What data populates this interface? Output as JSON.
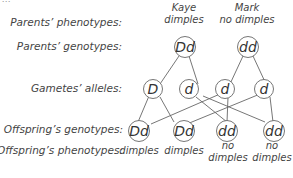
{
  "top_fragment": "...",
  "row_labels": {
    "parents_phenotypes": "Parents’ phenotypes:",
    "parents_genotypes": "Parents’ genotypes:",
    "gametes_alleles": "Gametes’ alleles:",
    "offspring_genotypes": "Offspring’s genotypes:",
    "offspring_phenotypes": "Offspring’s phenotypes:"
  },
  "parents": [
    {
      "name": "Kaye",
      "phenotype": "dimples",
      "genotype": "Dd"
    },
    {
      "name": "Mark",
      "phenotype": "no dimples",
      "genotype": "dd"
    }
  ],
  "gametes": [
    "D",
    "d",
    "d",
    "d"
  ],
  "offspring": [
    {
      "genotype": "Dd",
      "phenotype_line1": "dimples",
      "phenotype_line2": ""
    },
    {
      "genotype": "Dd",
      "phenotype_line1": "dimples",
      "phenotype_line2": ""
    },
    {
      "genotype": "dd",
      "phenotype_line1": "no",
      "phenotype_line2": "dimples"
    },
    {
      "genotype": "dd",
      "phenotype_line1": "no",
      "phenotype_line2": "dimples"
    }
  ],
  "colors": {
    "line": "#666666",
    "text": "#444444",
    "background": "#ffffff"
  }
}
